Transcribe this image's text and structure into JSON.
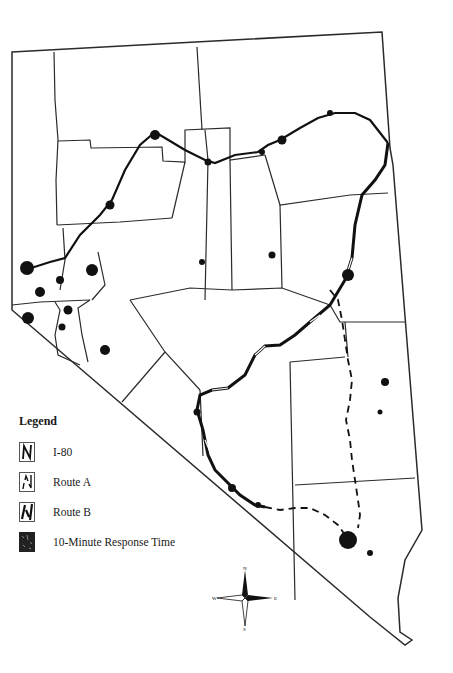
{
  "map": {
    "title": "Nevada counties with I-80 and alternate routes",
    "colors": {
      "boundary": "#2a2a2a",
      "route": "#111111",
      "response_area": "#111111",
      "background": "#ffffff"
    }
  },
  "legend": {
    "title": "Legend",
    "items": [
      {
        "label": "I-80",
        "icon": "i80-line-icon"
      },
      {
        "label": "Route A",
        "icon": "route-a-line-icon"
      },
      {
        "label": "Route B",
        "icon": "route-b-line-icon"
      },
      {
        "label": "10-Minute Response Time",
        "icon": "response-area-icon"
      }
    ]
  },
  "compass": {
    "n": "N",
    "s": "S",
    "e": "E",
    "w": "W"
  }
}
